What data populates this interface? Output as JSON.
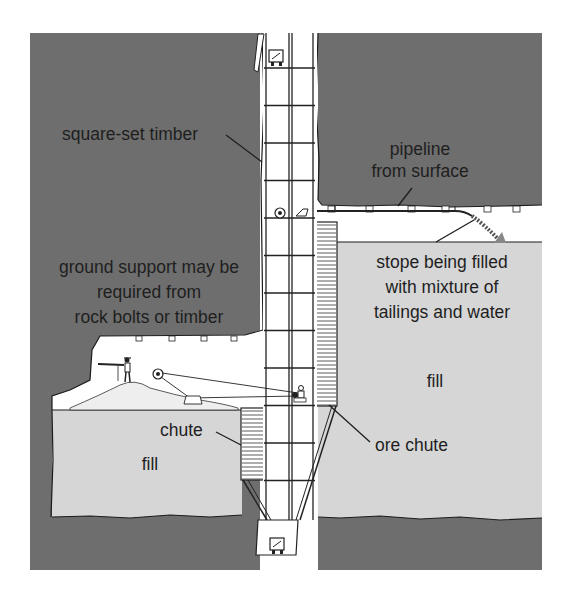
{
  "diagram": {
    "labels": {
      "square_set_timber": "square-set timber",
      "pipeline_line1": "pipeline",
      "pipeline_line2": "from surface",
      "ground_support_line1": "ground support may be",
      "ground_support_line2": "required from",
      "ground_support_line3": "rock bolts or timber",
      "stope_line1": "stope being filled",
      "stope_line2": "with mixture of",
      "stope_line3": "tailings and water",
      "fill_right": "fill",
      "fill_left": "fill",
      "chute": "chute",
      "ore_chute": "ore chute"
    },
    "colors": {
      "rock": "#6e6e6e",
      "fill": "#d6d6d6",
      "open_space": "#ffffff",
      "line": "#1c1c1c"
    },
    "components": [
      "rock-mass",
      "square-set-timber-shaft",
      "pipeline",
      "stope-fill",
      "ore-chute",
      "chute",
      "rock-bolts",
      "miner-drilling",
      "scraper-hoist",
      "ore-skip-top",
      "ore-skip-bottom"
    ]
  }
}
